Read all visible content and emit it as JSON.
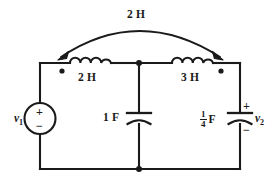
{
  "diagram": {
    "stroke_color": "#1a1a1a",
    "background": "#ffffff"
  },
  "components": {
    "mutual_inductance": {
      "label": "2 H",
      "icon": "double-headed-arc-arrow",
      "x": 139,
      "y": 15
    },
    "inductor_left": {
      "label": "2 H",
      "icon": "inductor-coil-icon",
      "dot_side": "left",
      "x": 90,
      "y": 80
    },
    "inductor_right": {
      "label": "3 H",
      "icon": "inductor-coil-icon",
      "dot_side": "right",
      "x": 192,
      "y": 80
    },
    "capacitor_center": {
      "label": "1 F",
      "icon": "polarized-capacitor-icon",
      "x": 120,
      "y": 118
    },
    "capacitor_right": {
      "numerator": "1",
      "denominator": "4",
      "unit": "F",
      "icon": "polarized-capacitor-icon",
      "plus": "+",
      "minus": "−",
      "x": 210,
      "y": 118
    },
    "source_left": {
      "label": "v",
      "subscript": "1",
      "icon": "voltage-source-icon",
      "plus": "+",
      "minus": "−",
      "x": 18,
      "y": 118
    },
    "output_right": {
      "label": "v",
      "subscript": "2",
      "icon": "voltage-label",
      "x": 252,
      "y": 118
    }
  }
}
